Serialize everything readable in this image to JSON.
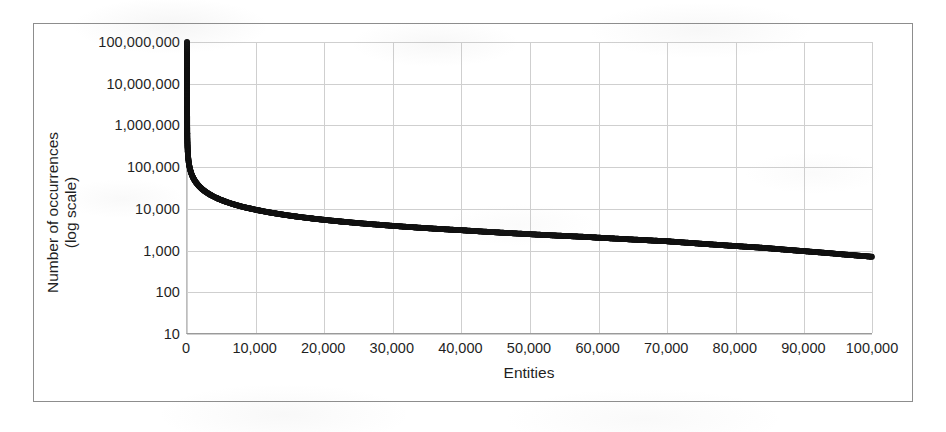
{
  "chart_data": {
    "type": "scatter",
    "title": "",
    "xlabel": "Entities",
    "ylabel_line1": "Number of occurrences",
    "ylabel_line2": "(log scale)",
    "xlim": [
      0,
      100000
    ],
    "ylim": [
      10,
      100000000
    ],
    "yscale": "log",
    "xscale": "linear",
    "grid": true,
    "legend": "none",
    "marker": "filled-circle",
    "marker_color": "#111111",
    "grid_color": "#cfcfcf",
    "frame_color": "#8d8d8d",
    "background": "#ffffff",
    "x_tick_labels": [
      "0",
      "10,000",
      "20,000",
      "30,000",
      "40,000",
      "50,000",
      "60,000",
      "70,000",
      "80,000",
      "90,000",
      "100,000"
    ],
    "x_tick_values": [
      0,
      10000,
      20000,
      30000,
      40000,
      50000,
      60000,
      70000,
      80000,
      90000,
      100000
    ],
    "y_tick_labels": [
      "100,000,000",
      "10,000,000",
      "1,000,000",
      "100,000",
      "10,000",
      "1,000",
      "100",
      "10"
    ],
    "y_tick_values": [
      100000000,
      10000000,
      1000000,
      100000,
      10000,
      1000,
      100,
      10
    ],
    "x": [
      1,
      2,
      3,
      5,
      8,
      12,
      18,
      26,
      38,
      55,
      80,
      115,
      165,
      240,
      345,
      500,
      720,
      1040,
      1500,
      2160,
      3120,
      4500,
      6500,
      9400,
      13500,
      19500,
      28000,
      40500,
      58000,
      70000,
      84000,
      92000,
      100000
    ],
    "y": [
      100000000,
      50000000,
      20000000,
      9000000,
      4200000,
      2300000,
      1400000,
      900000,
      620000,
      430000,
      310000,
      230000,
      175000,
      135000,
      105000,
      82000,
      64000,
      50000,
      39000,
      30000,
      23000,
      17500,
      13200,
      9900,
      7400,
      5500,
      4100,
      3000,
      2100,
      1650,
      1150,
      900,
      700
    ],
    "notable_points": [
      {
        "x": 1,
        "y": 100000000,
        "note": "most frequent entity"
      },
      {
        "x": 100000,
        "y": 700,
        "note": "least frequent entity shown"
      }
    ]
  },
  "axes": {
    "y_title_line1": "Number of occurrences",
    "y_title_line2": "(log scale)",
    "x_title": "Entities"
  }
}
